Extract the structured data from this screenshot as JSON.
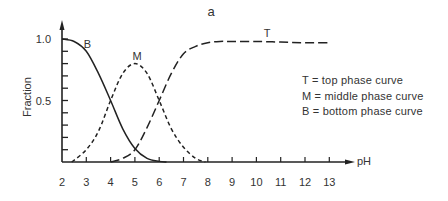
{
  "chart_data": {
    "type": "line",
    "title": "a",
    "xlabel": "pH",
    "ylabel": "Fraction",
    "xlim": [
      2,
      13
    ],
    "ylim": [
      0,
      1.0
    ],
    "x_ticks": [
      2,
      3,
      4,
      5,
      6,
      7,
      8,
      9,
      10,
      11,
      12,
      13
    ],
    "y_tick_labels": [
      {
        "value": 1.0,
        "label": "1.0"
      },
      {
        "value": 0.5,
        "label": "0.5"
      }
    ],
    "y_minor_ticks": [
      0.1,
      0.2,
      0.3,
      0.4,
      0.5,
      0.6,
      0.7,
      0.8,
      0.9,
      1.0
    ],
    "grid": false,
    "legend_position": "right",
    "series": [
      {
        "name": "B",
        "description": "bottom phase curve",
        "style": "solid",
        "x": [
          2.0,
          2.5,
          3.0,
          3.5,
          4.0,
          4.5,
          5.0,
          5.5,
          6.0,
          6.3
        ],
        "y": [
          1.0,
          0.98,
          0.9,
          0.72,
          0.5,
          0.27,
          0.11,
          0.03,
          0.005,
          0.0
        ],
        "label_pos": {
          "x": 2.9,
          "y": 0.96
        }
      },
      {
        "name": "M",
        "description": "middle phase curve",
        "style": "short-dash",
        "x": [
          2.4,
          3.0,
          3.5,
          4.0,
          4.5,
          5.0,
          5.5,
          6.0,
          6.5,
          7.0,
          7.5,
          7.9
        ],
        "y": [
          0.0,
          0.1,
          0.25,
          0.5,
          0.72,
          0.8,
          0.72,
          0.5,
          0.27,
          0.12,
          0.03,
          0.0
        ],
        "label_pos": {
          "x": 4.9,
          "y": 0.86
        }
      },
      {
        "name": "T",
        "description": "top phase curve",
        "style": "long-dash",
        "x": [
          4.0,
          4.5,
          5.0,
          5.5,
          6.0,
          6.5,
          7.0,
          7.5,
          8.0,
          8.5,
          9.0,
          10.0,
          11.0,
          12.0,
          13.0
        ],
        "y": [
          0.0,
          0.03,
          0.1,
          0.28,
          0.5,
          0.72,
          0.88,
          0.94,
          0.97,
          0.98,
          0.98,
          0.98,
          0.975,
          0.97,
          0.97
        ],
        "label_pos": {
          "x": 10.3,
          "y": 1.05
        }
      }
    ],
    "annotations": [
      "T = top phase curve",
      "M = middle phase curve",
      "B = bottom phase curve"
    ]
  },
  "legend": {
    "items": [
      "T = top phase curve",
      "M = middle phase curve",
      "B = bottom phase curve"
    ]
  }
}
